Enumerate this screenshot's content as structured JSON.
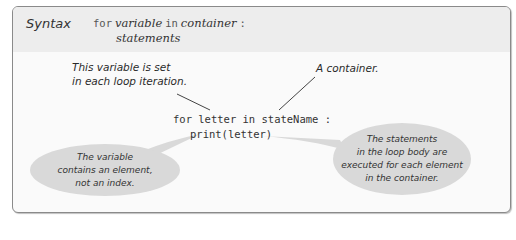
{
  "header": {
    "label": "Syntax",
    "syntax": {
      "kw_for": "for",
      "var": "variable",
      "kw_in": "in",
      "container": "container",
      "colon": ":",
      "body": "statements"
    }
  },
  "code": {
    "line1": "for letter in stateName :",
    "line2": "print(letter)"
  },
  "annotations": {
    "variable_note": [
      "This variable is set",
      "in each loop iteration."
    ],
    "container_note": "A container."
  },
  "bubbles": {
    "left": [
      "The variable",
      "contains an element,",
      "not an index."
    ],
    "right": [
      "The statements",
      "in the loop body are",
      "executed for each element",
      "in the container."
    ]
  },
  "colors": {
    "header_bg": "#ededed",
    "body_bg": "#fafafa",
    "bubble_bg": "#d9d9d9",
    "border": "#8a8a8a"
  }
}
